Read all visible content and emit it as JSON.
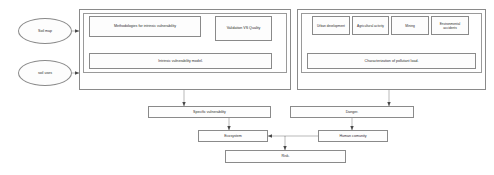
{
  "diagram": {
    "type": "flowchart",
    "colors": {
      "stroke": "#8a8a8a",
      "text": "#2b2b2b",
      "background": "#ffffff",
      "node_fill": "#fdfdfd"
    },
    "inputs": [
      {
        "id": "soil-map",
        "label": "Soil map",
        "shape": "ellipse"
      },
      {
        "id": "soil-uses",
        "label": "soil uses",
        "shape": "ellipse"
      }
    ],
    "groups": [
      {
        "id": "intrinsic-vulnerability-group",
        "label": "",
        "nodes": [
          {
            "id": "methodologies",
            "label": "Methodologies for intrinsic vulnerability"
          },
          {
            "id": "validation-quality",
            "label": "Validation VS Quality"
          },
          {
            "id": "intrinsic-model",
            "label": "Intrinsic vulnerability model."
          }
        ]
      },
      {
        "id": "pollutant-load-group",
        "label": "",
        "nodes": [
          {
            "id": "urban-development",
            "label": "Urban development"
          },
          {
            "id": "agricultural-activity",
            "label": "Agricultural activity"
          },
          {
            "id": "mining",
            "label": "Mining"
          },
          {
            "id": "environmental-accidents",
            "label": "Environmental accidents"
          },
          {
            "id": "characterization",
            "label": "Characterization of pollutant load."
          }
        ]
      }
    ],
    "outcomes": [
      {
        "id": "specific-vulnerability",
        "label": "Specific vulnerability"
      },
      {
        "id": "danger",
        "label": "Danger."
      },
      {
        "id": "ecosystem",
        "label": "Ecosystem"
      },
      {
        "id": "human-community",
        "label": "Human comunity"
      },
      {
        "id": "risk",
        "label": "Risk."
      }
    ],
    "edges": [
      {
        "from": "soil-map",
        "to": "intrinsic-vulnerability-group"
      },
      {
        "from": "soil-uses",
        "to": "intrinsic-vulnerability-group"
      },
      {
        "from": "methodologies",
        "to": "validation-quality"
      },
      {
        "from": "methodologies",
        "to": "intrinsic-model"
      },
      {
        "from": "validation-quality",
        "to": "intrinsic-model"
      },
      {
        "from": "urban-development",
        "to": "characterization"
      },
      {
        "from": "agricultural-activity",
        "to": "characterization"
      },
      {
        "from": "mining",
        "to": "characterization"
      },
      {
        "from": "environmental-accidents",
        "to": "characterization"
      },
      {
        "from": "intrinsic-vulnerability-group",
        "to": "specific-vulnerability"
      },
      {
        "from": "pollutant-load-group",
        "to": "danger"
      },
      {
        "from": "specific-vulnerability",
        "to": "ecosystem"
      },
      {
        "from": "danger",
        "to": "human-community"
      },
      {
        "from": "human-community",
        "to": "ecosystem"
      },
      {
        "from": "ecosystem",
        "to": "risk"
      }
    ]
  }
}
